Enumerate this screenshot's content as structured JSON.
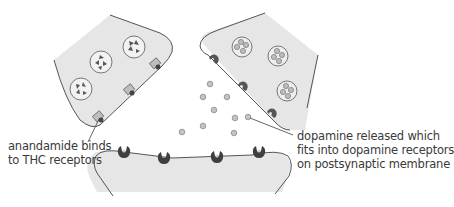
{
  "diagram": {
    "type": "synapse",
    "colors": {
      "cell_fill": "#e6e6e6",
      "cell_stroke": "#555555",
      "vesicle_stroke": "#777777",
      "thc_receptor": "#555555",
      "dopamine_dot": "#bdbdbd",
      "dopamine_receptor": "#3f3f3f",
      "text": "#3a3a3a"
    },
    "labels": {
      "anandamide": {
        "line1": "anandamide binds",
        "line2": "to THC receptors"
      },
      "dopamine": {
        "line1": "dopamine released which",
        "line2": "fits into dopamine receptors",
        "line3": "on postsynaptic membrane"
      }
    },
    "components": {
      "left_neuron": "presynaptic neuron with anandamide vesicles",
      "right_neuron": "presynaptic neuron with dopamine vesicles",
      "bottom_neuron": "postsynaptic membrane with dopamine receptors"
    }
  }
}
